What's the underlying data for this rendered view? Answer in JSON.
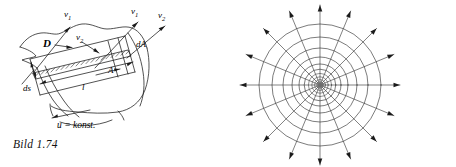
{
  "page": {
    "width": 456,
    "height": 167,
    "background": "#ffffff",
    "ink": "#1a1a1a"
  },
  "figures": [
    {
      "id": "bild-1-74",
      "caption": "Bild 1.74",
      "kind": "technical-line-drawing",
      "description": "Stream filament / flow tube bounded by a curved surface, with a hatched band of cross-section A and length l, velocity vectors and differential elements.",
      "labels": {
        "v1_left": "v",
        "v1_left_sub": "1",
        "v1_right": "v",
        "v1_right_sub": "1",
        "v2_inner": "v",
        "v2_inner_sub": "2",
        "v2_right": "v",
        "v2_right_sub": "2",
        "displacement": "D",
        "area_element": "dA",
        "arc_element": "ds",
        "length": "l",
        "area": "A",
        "condition": "u = konst."
      }
    },
    {
      "id": "bild-1-75",
      "caption": "Bild 1.75",
      "kind": "radial-field-diagram",
      "description": "Plane radial source field: concentric equipotential circles crossed by sixteen straight field lines with outward arrowheads.",
      "geometry": {
        "center_x": 92,
        "center_y": 85,
        "ray_count": 16,
        "ray_angle_step_deg": 22.5,
        "circle_radii": [
          3.2,
          5.4,
          8.2,
          11.6,
          15.8,
          21.0,
          28.0,
          37.0,
          48.0,
          61.0
        ],
        "arrow_tip_radius": 80
      }
    }
  ],
  "colors": {
    "ink": "#1a1a1a",
    "hairline": "#3a3a3a",
    "paper": "#ffffff"
  }
}
